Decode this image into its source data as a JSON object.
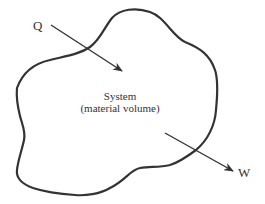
{
  "diagram": {
    "labels": {
      "heat": "Q",
      "work": "W",
      "system_line1": "System",
      "system_line2": "(material volume)"
    },
    "colors": {
      "stroke": "#333333",
      "background": "#ffffff"
    }
  }
}
